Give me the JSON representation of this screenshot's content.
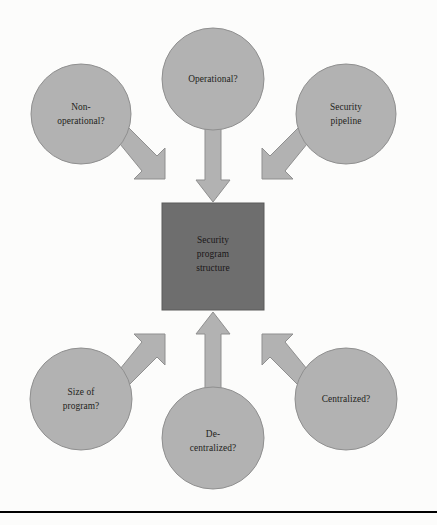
{
  "diagram": {
    "title": "Security program structure",
    "type": "hub-and-spoke",
    "center": {
      "id": "center-node",
      "shape": "square",
      "lines": [
        "Security",
        "program",
        "structure"
      ],
      "fill": "#6e6e6e",
      "stroke": "#5a5a5a",
      "x": 162,
      "y": 203,
      "width": 102,
      "height": 107
    },
    "nodes": [
      {
        "id": "non-operational",
        "name": "non-operational-node",
        "lines": [
          "Non-",
          "operational?"
        ],
        "cx": 81,
        "cy": 114,
        "r": 50,
        "fill": "#b2b2b2",
        "stroke": "#8f8f8f"
      },
      {
        "id": "operational",
        "name": "operational-node",
        "lines": [
          "Operational?"
        ],
        "cx": 213,
        "cy": 79,
        "r": 51,
        "fill": "#b2b2b2",
        "stroke": "#8f8f8f"
      },
      {
        "id": "security-pipeline",
        "name": "security-pipeline-node",
        "lines": [
          "Security",
          "pipeline"
        ],
        "cx": 346,
        "cy": 114,
        "r": 50,
        "fill": "#b2b2b2",
        "stroke": "#8f8f8f"
      },
      {
        "id": "size-of-program",
        "name": "size-of-program-node",
        "lines": [
          "Size of",
          "program?"
        ],
        "cx": 81,
        "cy": 399,
        "r": 51,
        "fill": "#b2b2b2",
        "stroke": "#8f8f8f"
      },
      {
        "id": "de-centralized",
        "name": "de-centralized-node",
        "lines": [
          "De-",
          "centralized?"
        ],
        "cx": 213,
        "cy": 438,
        "r": 51,
        "fill": "#b2b2b2",
        "stroke": "#8f8f8f"
      },
      {
        "id": "centralized",
        "name": "centralized-node",
        "lines": [
          "Centralized?"
        ],
        "cx": 346,
        "cy": 399,
        "r": 51,
        "fill": "#b2b2b2",
        "stroke": "#8f8f8f"
      }
    ],
    "arrows": [
      {
        "id": "arrow-non-operational",
        "from": "non-operational",
        "to": "center-node",
        "direction": "down-right"
      },
      {
        "id": "arrow-operational",
        "from": "operational",
        "to": "center-node",
        "direction": "down"
      },
      {
        "id": "arrow-security-pipeline",
        "from": "security-pipeline",
        "to": "center-node",
        "direction": "down-left"
      },
      {
        "id": "arrow-size-of-program",
        "from": "size-of-program",
        "to": "center-node",
        "direction": "up-right"
      },
      {
        "id": "arrow-de-centralized",
        "from": "de-centralized",
        "to": "center-node",
        "direction": "up"
      },
      {
        "id": "arrow-centralized",
        "from": "centralized",
        "to": "center-node",
        "direction": "up-left"
      }
    ],
    "arrow_style": {
      "fill": "#b2b2b2",
      "stroke": "#8f8f8f"
    },
    "background": "#fcfcfb",
    "footer_rule_color": "#000000"
  }
}
